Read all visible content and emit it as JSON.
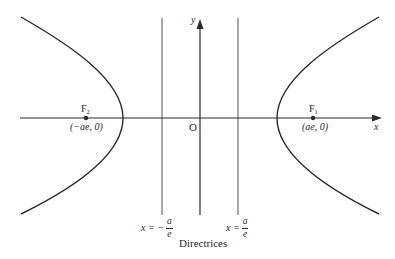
{
  "diagram": {
    "type": "hyperbola",
    "axes": {
      "x_label": "x",
      "y_label": "y",
      "origin_label": "O"
    },
    "foci": [
      {
        "name": "F",
        "subscript": "2",
        "coords": "(−ae, 0)"
      },
      {
        "name": "F",
        "subscript": "1",
        "coords": "(ae, 0)"
      }
    ],
    "directrices": {
      "left": {
        "lhs": "x = −",
        "num": "a",
        "den": "e"
      },
      "right": {
        "lhs": "x =",
        "num": "a",
        "den": "e"
      },
      "caption": "Directrices"
    },
    "colors": {
      "curve": "#2a2a2a",
      "axis": "#2a2a2a",
      "directrix": "#555555"
    }
  }
}
